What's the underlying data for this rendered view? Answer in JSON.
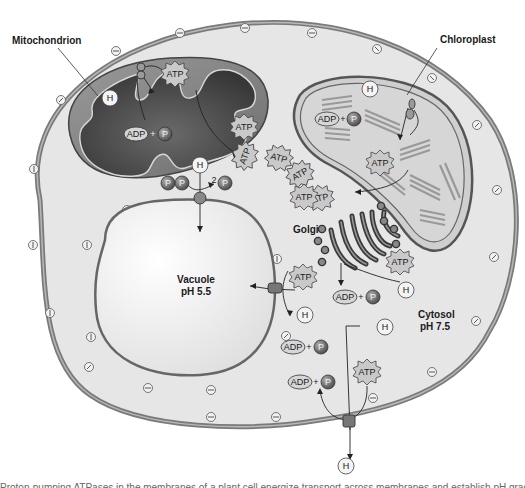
{
  "figure": {
    "labels": {
      "mitochondrion": "Mitochondrion",
      "chloroplast": "Chloroplast",
      "golgi": "Golgi",
      "vacuole": "Vacuole",
      "vacuole_ph": "pH 5.5",
      "cytosol": "Cytosol",
      "cytosol_ph": "pH 7.5"
    },
    "molecules": {
      "atp": "ATP",
      "adp": "ADP",
      "p": "P",
      "pi_sub": "i",
      "h": "H",
      "h_sup": "+",
      "plus": "+",
      "two": "2"
    },
    "membrane_charges": {
      "outer_symbol": "−",
      "inner_symbol": "/"
    },
    "colors": {
      "cell_wall": "#8a8a8a",
      "cytosol": "#e6e6e6",
      "vacuole": "#f4f4f4",
      "mito_dark": "#555555",
      "mito_mid": "#8c8c8c",
      "chloro_fill": "#cfcfcf",
      "thylakoid": "#9a9a9a",
      "atp_fill": "#c8c8c8",
      "phosphate": "#6f6f6f"
    },
    "caption": "Proton-pumping ATPases in the membranes of a plant cell energize transport across membranes and establish pH gradients between compartments."
  }
}
